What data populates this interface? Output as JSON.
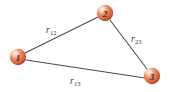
{
  "figure": {
    "type": "triangle-node-diagram",
    "background_color": "#ffffff",
    "width": 170,
    "height": 92,
    "edge_color": "#4a4a4a",
    "node_fill_color": "#e8825e",
    "node_highlight_color": "#f7cdb6",
    "node_shadow_color": "#b8512f",
    "node_label_color": "#4a2a1c"
  },
  "nodes": [
    {
      "id": "1",
      "label": "1",
      "cx": 18,
      "cy": 57,
      "r": 8.2
    },
    {
      "id": "2",
      "label": "2",
      "cx": 105,
      "cy": 13,
      "r": 8.2
    },
    {
      "id": "3",
      "label": "3",
      "cx": 152,
      "cy": 76,
      "r": 8.2
    }
  ],
  "edges": [
    {
      "id": "e12",
      "from": "1",
      "to": "2",
      "x1": 25,
      "y1": 53,
      "x2": 98,
      "y2": 17
    },
    {
      "id": "e23",
      "from": "2",
      "to": "3",
      "x1": 110,
      "y1": 20,
      "x2": 147,
      "y2": 69
    },
    {
      "id": "e13",
      "from": "1",
      "to": "3",
      "x1": 26,
      "y1": 60,
      "x2": 145,
      "y2": 78
    }
  ],
  "edge_labels": [
    {
      "id": "r12",
      "symbol": "r",
      "subscript": "12",
      "x": 46,
      "y": 20
    },
    {
      "id": "r23",
      "symbol": "r",
      "subscript": "23",
      "x": 131,
      "y": 29
    },
    {
      "id": "r13",
      "symbol": "r",
      "subscript": "13",
      "x": 70,
      "y": 71
    }
  ]
}
